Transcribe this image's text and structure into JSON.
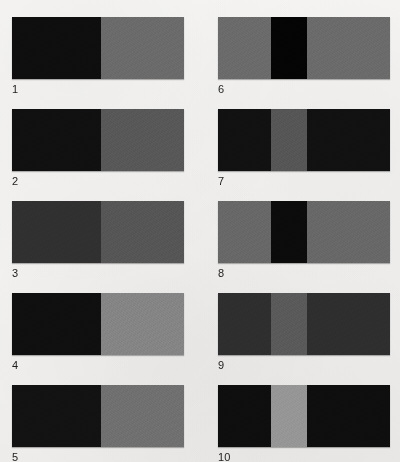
{
  "figure": {
    "background_color": "#f2f1ef",
    "label_color": "#1d1d1d",
    "columns": 2,
    "rows": 5,
    "total_stimuli": 10
  },
  "chart_data": {
    "type": "heatmap",
    "title": "",
    "xlabel": "",
    "ylabel": "",
    "legend_position": "none",
    "grid": false,
    "value_unit": "8-bit gray level",
    "categories": [
      "1",
      "2",
      "3",
      "4",
      "5",
      "6",
      "7",
      "8",
      "9",
      "10"
    ],
    "series": [
      {
        "name": "left region gray level",
        "values": [
          14,
          16,
          48,
          15,
          18,
          107,
          17,
          104,
          46,
          14
        ]
      },
      {
        "name": "center region gray level",
        "values": [
          null,
          null,
          null,
          null,
          null,
          4,
          86,
          11,
          90,
          150
        ]
      },
      {
        "name": "right region gray level",
        "values": [
          107,
          88,
          86,
          133,
          112,
          107,
          17,
          104,
          46,
          14
        ]
      }
    ]
  },
  "stimuli": [
    {
      "number": "1",
      "column": "left",
      "kind": "two-region-edge",
      "patches": [
        {
          "name": "left-patch",
          "color": "#0e0e0e",
          "width_pct": 52
        },
        {
          "name": "right-patch",
          "color": "#6b6b6b",
          "width_pct": 48
        }
      ]
    },
    {
      "number": "2",
      "column": "left",
      "kind": "two-region-edge",
      "patches": [
        {
          "name": "left-patch",
          "color": "#101010",
          "width_pct": 52
        },
        {
          "name": "right-patch",
          "color": "#585858",
          "width_pct": 48
        }
      ]
    },
    {
      "number": "3",
      "column": "left",
      "kind": "two-region-edge",
      "patches": [
        {
          "name": "left-patch",
          "color": "#303030",
          "width_pct": 52
        },
        {
          "name": "right-patch",
          "color": "#565656",
          "width_pct": 48
        }
      ]
    },
    {
      "number": "4",
      "column": "left",
      "kind": "two-region-edge",
      "patches": [
        {
          "name": "left-patch",
          "color": "#0f0f0f",
          "width_pct": 52
        },
        {
          "name": "right-patch",
          "color": "#858585",
          "width_pct": 48
        }
      ]
    },
    {
      "number": "5",
      "column": "left",
      "kind": "two-region-edge",
      "patches": [
        {
          "name": "left-patch",
          "color": "#121212",
          "width_pct": 52
        },
        {
          "name": "right-patch",
          "color": "#707070",
          "width_pct": 48
        }
      ]
    },
    {
      "number": "6",
      "column": "right",
      "kind": "three-region-band",
      "patches": [
        {
          "name": "left-patch",
          "color": "#6b6b6b",
          "width_pct": 31
        },
        {
          "name": "center-patch",
          "color": "#040404",
          "width_pct": 21
        },
        {
          "name": "right-patch",
          "color": "#6b6b6b",
          "width_pct": 48
        }
      ]
    },
    {
      "number": "7",
      "column": "right",
      "kind": "three-region-band",
      "patches": [
        {
          "name": "left-patch",
          "color": "#111111",
          "width_pct": 31
        },
        {
          "name": "center-patch",
          "color": "#565656",
          "width_pct": 21
        },
        {
          "name": "right-patch",
          "color": "#111111",
          "width_pct": 48
        }
      ]
    },
    {
      "number": "8",
      "column": "right",
      "kind": "three-region-band",
      "patches": [
        {
          "name": "left-patch",
          "color": "#686868",
          "width_pct": 31
        },
        {
          "name": "center-patch",
          "color": "#0b0b0b",
          "width_pct": 21
        },
        {
          "name": "right-patch",
          "color": "#686868",
          "width_pct": 48
        }
      ]
    },
    {
      "number": "9",
      "column": "right",
      "kind": "three-region-band",
      "patches": [
        {
          "name": "left-patch",
          "color": "#2e2e2e",
          "width_pct": 31
        },
        {
          "name": "center-patch",
          "color": "#5a5a5a",
          "width_pct": 21
        },
        {
          "name": "right-patch",
          "color": "#2e2e2e",
          "width_pct": 48
        }
      ]
    },
    {
      "number": "10",
      "column": "right",
      "kind": "three-region-band",
      "patches": [
        {
          "name": "left-patch",
          "color": "#0e0e0e",
          "width_pct": 31
        },
        {
          "name": "center-patch",
          "color": "#969696",
          "width_pct": 21
        },
        {
          "name": "right-patch",
          "color": "#0e0e0e",
          "width_pct": 48
        }
      ]
    }
  ],
  "geometry": {
    "left_column_x": 12,
    "right_column_x": 218,
    "bar_width": 172,
    "bar_height": 62,
    "row_tops": [
      17,
      109,
      201,
      293,
      385
    ],
    "label_offset_y": 66
  }
}
